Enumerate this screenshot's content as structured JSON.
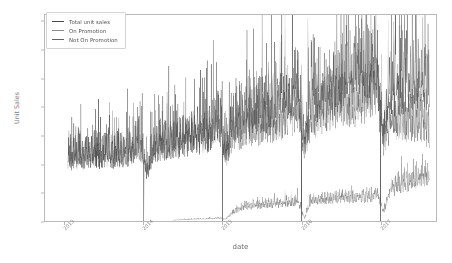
{
  "chart_data": {
    "type": "line",
    "title": "",
    "xlabel": "date",
    "ylabel": "Unit Sales",
    "grid": false,
    "legend_position": "upper left",
    "ylim": [
      0,
      1450000
    ],
    "yticks": [
      0,
      200000,
      400000,
      600000,
      800000,
      1000000,
      1200000,
      1400000
    ],
    "ytick_labels": [
      "0",
      "200000",
      "400000",
      "600000",
      "800000",
      "1000000",
      "1200000",
      "1400000"
    ],
    "xlim": [
      "2012-10-01",
      "2017-09-15"
    ],
    "xticks": [
      "2013",
      "2014",
      "2015",
      "2016",
      "2017"
    ],
    "xtick_labels": [
      "2013",
      "2014",
      "2015",
      "2016",
      "2017"
    ],
    "series": [
      {
        "name": "Total unit sales",
        "color": "#4a4a4a",
        "x": [
          "2013-01",
          "2013-02",
          "2013-03",
          "2013-04",
          "2013-05",
          "2013-06",
          "2013-07",
          "2013-08",
          "2013-09",
          "2013-10",
          "2013-11",
          "2013-12",
          "2014-01",
          "2014-02",
          "2014-03",
          "2014-04",
          "2014-05",
          "2014-06",
          "2014-07",
          "2014-08",
          "2014-09",
          "2014-10",
          "2014-11",
          "2014-12",
          "2015-01",
          "2015-02",
          "2015-03",
          "2015-04",
          "2015-05",
          "2015-06",
          "2015-07",
          "2015-08",
          "2015-09",
          "2015-10",
          "2015-11",
          "2015-12",
          "2016-01",
          "2016-02",
          "2016-03",
          "2016-04",
          "2016-05",
          "2016-06",
          "2016-07",
          "2016-08",
          "2016-09",
          "2016-10",
          "2016-11",
          "2016-12",
          "2017-01",
          "2017-02",
          "2017-03",
          "2017-04",
          "2017-05",
          "2017-06",
          "2017-07",
          "2017-08"
        ],
        "values": [
          430000,
          420000,
          430000,
          425000,
          440000,
          430000,
          445000,
          440000,
          450000,
          455000,
          470000,
          520000,
          330000,
          480000,
          500000,
          510000,
          520000,
          530000,
          545000,
          555000,
          560000,
          575000,
          600000,
          680000,
          430000,
          640000,
          660000,
          680000,
          700000,
          720000,
          740000,
          760000,
          770000,
          790000,
          810000,
          900000,
          500000,
          800000,
          830000,
          860000,
          880000,
          900000,
          910000,
          920000,
          930000,
          940000,
          960000,
          1040000,
          560000,
          870000,
          890000,
          900000,
          910000,
          920000,
          930000,
          880000
        ],
        "peak_max": 1400000,
        "baseline_min": 0
      },
      {
        "name": "On Promotion",
        "color": "#737373",
        "x": [
          "2014-05",
          "2014-06",
          "2014-07",
          "2014-08",
          "2014-09",
          "2014-10",
          "2014-11",
          "2014-12",
          "2015-01",
          "2015-02",
          "2015-03",
          "2015-04",
          "2015-05",
          "2015-06",
          "2015-07",
          "2015-08",
          "2015-09",
          "2015-10",
          "2015-11",
          "2015-12",
          "2016-01",
          "2016-02",
          "2016-03",
          "2016-04",
          "2016-05",
          "2016-06",
          "2016-07",
          "2016-08",
          "2016-09",
          "2016-10",
          "2016-11",
          "2016-12",
          "2017-01",
          "2017-02",
          "2017-03",
          "2017-04",
          "2017-05",
          "2017-06",
          "2017-07",
          "2017-08"
        ],
        "values": [
          5000,
          8000,
          10000,
          12000,
          14000,
          15000,
          16000,
          20000,
          12000,
          55000,
          80000,
          95000,
          100000,
          105000,
          110000,
          112000,
          115000,
          118000,
          120000,
          135000,
          20000,
          130000,
          140000,
          145000,
          150000,
          150000,
          152000,
          155000,
          158000,
          160000,
          165000,
          185000,
          60000,
          200000,
          230000,
          250000,
          260000,
          270000,
          285000,
          300000
        ],
        "peak_max": 360000,
        "baseline_min": 0
      },
      {
        "name": "Not On Promotion",
        "color": "#5e5e5e",
        "x": [
          "2013-01",
          "2013-02",
          "2013-03",
          "2013-04",
          "2013-05",
          "2013-06",
          "2013-07",
          "2013-08",
          "2013-09",
          "2013-10",
          "2013-11",
          "2013-12",
          "2014-01",
          "2014-02",
          "2014-03",
          "2014-04",
          "2014-05",
          "2014-06",
          "2014-07",
          "2014-08",
          "2014-09",
          "2014-10",
          "2014-11",
          "2014-12",
          "2015-01",
          "2015-02",
          "2015-03",
          "2015-04",
          "2015-05",
          "2015-06",
          "2015-07",
          "2015-08",
          "2015-09",
          "2015-10",
          "2015-11",
          "2015-12",
          "2016-01",
          "2016-02",
          "2016-03",
          "2016-04",
          "2016-05",
          "2016-06",
          "2016-07",
          "2016-08",
          "2016-09",
          "2016-10",
          "2016-11",
          "2016-12",
          "2017-01",
          "2017-02",
          "2017-03",
          "2017-04",
          "2017-05",
          "2017-06",
          "2017-07",
          "2017-08"
        ],
        "values": [
          430000,
          420000,
          430000,
          425000,
          440000,
          430000,
          445000,
          440000,
          450000,
          455000,
          470000,
          520000,
          330000,
          478000,
          496000,
          504000,
          512000,
          520000,
          533000,
          541000,
          544000,
          558000,
          582000,
          658000,
          418000,
          585000,
          580000,
          585000,
          600000,
          615000,
          630000,
          648000,
          655000,
          672000,
          690000,
          765000,
          480000,
          670000,
          690000,
          715000,
          730000,
          750000,
          758000,
          765000,
          772000,
          780000,
          795000,
          855000,
          500000,
          670000,
          660000,
          650000,
          650000,
          650000,
          645000,
          580000
        ],
        "peak_max": 1180000,
        "baseline_min": 0
      }
    ]
  },
  "legend": {
    "items": [
      {
        "label": "Total unit sales",
        "color": "#4a4a4a"
      },
      {
        "label": "On Promotion",
        "color": "#8c8c8c"
      },
      {
        "label": "Not On Promotion",
        "color": "#636363"
      }
    ]
  },
  "axes": {
    "ylabel": "Unit Sales",
    "xlabel": "date",
    "ytick_labels": [
      "1400000",
      "1200000",
      "1000000",
      "800000",
      "600000",
      "400000",
      "200000",
      "0"
    ],
    "xtick_labels": [
      "2013",
      "2014",
      "2015",
      "2016",
      "2017"
    ]
  }
}
